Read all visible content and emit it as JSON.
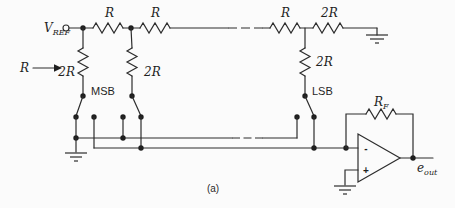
{
  "diagram": {
    "type": "R-2R ladder DAC circuit schematic",
    "caption": "(a)",
    "colors": {
      "background": "#fbfbfb",
      "line": "#2d2d2d",
      "text": "#1f1f1f"
    },
    "labels": {
      "vref_base": "V",
      "vref_sub": "REF",
      "input_resistance": "R",
      "series_r": [
        "R",
        "R",
        "R"
      ],
      "terminating_r": "2R",
      "shunt_r": [
        "2R",
        "2R",
        "2R"
      ],
      "msb": "MSB",
      "lsb": "LSB",
      "feedback_base": "R",
      "feedback_sub": "F",
      "opamp_minus": "-",
      "opamp_plus": "+",
      "output_base": "e",
      "output_sub": "out"
    }
  }
}
